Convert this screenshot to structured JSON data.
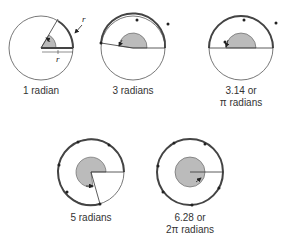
{
  "diagrams": [
    {
      "label": "1 radian",
      "label2": ""
    },
    {
      "label": "3 radians",
      "label2": ""
    },
    {
      "label": "3.14 or",
      "label2": "π radians"
    },
    {
      "label": "5 radians",
      "label2": ""
    },
    {
      "label": "6.28 or",
      "label2": "2π radians"
    }
  ],
  "annotations": {
    "r_arc": "r",
    "r_radius": "r"
  }
}
